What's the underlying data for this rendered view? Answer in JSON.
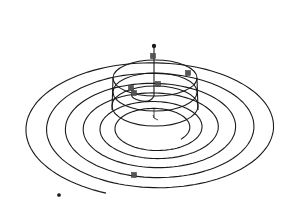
{
  "diagram": {
    "type": "3d-wireframe",
    "colors": {
      "background": "#ffffff",
      "stroke": "#1a1a1a",
      "marker": "#555555"
    },
    "spiral": {
      "center": [
        155,
        128
      ],
      "turns": [
        {
          "rx": 133,
          "ry": 70
        },
        {
          "rx": 112,
          "ry": 59
        },
        {
          "rx": 93,
          "ry": 49
        },
        {
          "rx": 75,
          "ry": 39
        },
        {
          "rx": 58,
          "ry": 30
        },
        {
          "rx": 42,
          "ry": 22
        }
      ],
      "end_point": [
        59,
        195
      ]
    },
    "helix": {
      "center_x": 155,
      "rings": [
        {
          "cy": 78,
          "rx": 42,
          "ry": 18
        },
        {
          "cy": 92,
          "rx": 42,
          "ry": 19
        },
        {
          "cy": 106,
          "rx": 43,
          "ry": 20
        }
      ]
    },
    "axis": {
      "top": [
        154,
        46
      ],
      "bottom": [
        154,
        96
      ]
    },
    "markers": [
      {
        "x": 158,
        "y": 84
      },
      {
        "x": 188,
        "y": 73
      },
      {
        "x": 131,
        "y": 88
      },
      {
        "x": 134,
        "y": 93
      },
      {
        "x": 153,
        "y": 56
      },
      {
        "x": 134,
        "y": 175
      }
    ],
    "triad": {
      "origin": [
        154,
        118
      ]
    }
  }
}
